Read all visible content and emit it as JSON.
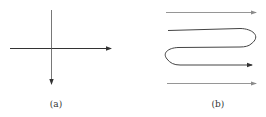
{
  "panels": [
    {
      "id": "a",
      "label": "(a)",
      "description": "Coordinate axes: horizontal arrow pointing right, vertical line with arrow pointing down"
    },
    {
      "id": "b",
      "label": "(b)",
      "description": "Two straight right-pointing arrows (top and bottom) surrounding a serpentine path that loops right then left and ends in a right-pointing arrow"
    }
  ],
  "colors": {
    "line_dark": "#333333",
    "line_light": "#8a8a8a",
    "background": "#ffffff"
  }
}
